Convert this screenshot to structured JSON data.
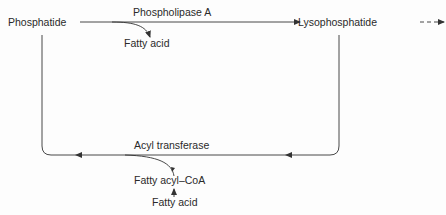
{
  "diagram": {
    "nodes": {
      "phosphatide": "Phosphatide",
      "lysophosphatide": "Lysophosphatide",
      "fatty_acid_product": "Fatty acid",
      "fatty_acyl_coa": "Fatty acyl–CoA",
      "fatty_acid_substrate": "Fatty acid"
    },
    "enzymes": {
      "phospholipase": "Phospholipase A",
      "acyl_transferase": "Acyl transferase"
    },
    "colors": {
      "line": "#333333",
      "text": "#2a2a2a",
      "background": "#fdfdfd"
    }
  }
}
